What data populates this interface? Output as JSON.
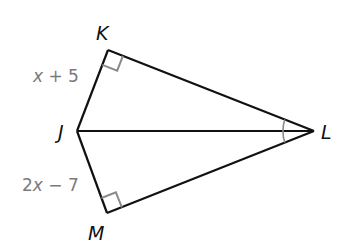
{
  "diagram": {
    "type": "kite-geometry",
    "vertices": {
      "K": {
        "label": "K",
        "x": 108,
        "y": 50
      },
      "J": {
        "label": "J",
        "x": 77,
        "y": 131
      },
      "L": {
        "label": "L",
        "x": 314,
        "y": 131
      },
      "M": {
        "label": "M",
        "x": 107,
        "y": 213
      }
    },
    "segments": [
      "JK",
      "KL",
      "JL",
      "JM",
      "ML"
    ],
    "right_angles": [
      "K",
      "M"
    ],
    "congruent_angle_marks": [
      "KLJ",
      "JLM"
    ],
    "side_labels": {
      "JK": {
        "coef": "",
        "var": "x",
        "rest": " + 5"
      },
      "JM": {
        "coef": "2",
        "var": "x",
        "rest": " − 7"
      }
    },
    "colors": {
      "line": "#111111",
      "mark": "#8a8a8a",
      "label": "#7a7a7a"
    }
  }
}
